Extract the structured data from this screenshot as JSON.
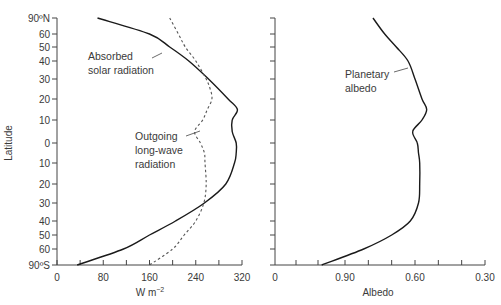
{
  "chart_data": [
    {
      "type": "line",
      "title": "",
      "xlabel": "W m⁻²",
      "ylabel": "Latitude",
      "xlim": [
        0,
        320
      ],
      "x_ticks": [
        0,
        80,
        160,
        240,
        320
      ],
      "x_minor_step": 40,
      "y_ticks": [
        "90ºN",
        "60",
        "50",
        "40",
        "30",
        "20",
        "10",
        "0",
        "10",
        "20",
        "30",
        "40",
        "50",
        "60",
        "90ºS"
      ],
      "y_axis_note": "sine-of-latitude spacing, north at top",
      "grid": false,
      "legend": "inline annotations",
      "series": [
        {
          "name": "Absorbed solar radiation",
          "style": "solid",
          "lat": [
            90,
            60,
            50,
            40,
            30,
            20,
            15,
            10,
            5,
            0,
            -5,
            -10,
            -20,
            -30,
            -40,
            -50,
            -60,
            -90
          ],
          "values": [
            70,
            160,
            195,
            228,
            262,
            296,
            312,
            303,
            303,
            310,
            310,
            307,
            292,
            255,
            205,
            160,
            115,
            35
          ]
        },
        {
          "name": "Outgoing long-wave radiation",
          "style": "dashed",
          "lat": [
            90,
            60,
            50,
            40,
            30,
            25,
            20,
            15,
            10,
            5,
            0,
            -5,
            -10,
            -20,
            -30,
            -40,
            -50,
            -60,
            -90
          ],
          "values": [
            195,
            210,
            222,
            240,
            258,
            265,
            268,
            260,
            252,
            238,
            248,
            255,
            256,
            258,
            254,
            240,
            220,
            200,
            160
          ]
        }
      ],
      "annotations": [
        {
          "text": [
            "Absorbed",
            "solar radiation"
          ],
          "points_to": "Absorbed solar radiation"
        },
        {
          "text": [
            "Outgoing",
            "long-wave",
            "radiation"
          ],
          "points_to": "Outgoing long-wave radiation"
        }
      ]
    },
    {
      "type": "line",
      "title": "",
      "xlabel": "Albedo",
      "ylabel": "",
      "x_ticks": [
        "0",
        "0.90",
        "0.60",
        "0.30"
      ],
      "x_axis_note": "reversed axis: 0.90 to 0.30 left to right, with 0 at far left",
      "y_ticks": "shared with left panel (unlabeled)",
      "grid": false,
      "series": [
        {
          "name": "Planetary albedo",
          "style": "solid",
          "lat": [
            90,
            60,
            50,
            40,
            30,
            20,
            15,
            10,
            5,
            0,
            -5,
            -10,
            -20,
            -30,
            -40,
            -50,
            -60,
            -90
          ],
          "values": [
            0.78,
            0.73,
            0.68,
            0.63,
            0.6,
            0.57,
            0.55,
            0.57,
            0.61,
            0.59,
            0.585,
            0.58,
            0.58,
            0.585,
            0.62,
            0.7,
            0.82,
            1.0
          ]
        }
      ],
      "annotations": [
        {
          "text": [
            "Planetary",
            "albedo"
          ],
          "points_to": "Planetary albedo"
        }
      ]
    }
  ],
  "left": {
    "ylabel": "Latitude",
    "xlabel_main": "W m",
    "xlabel_sup": "−2",
    "x_tick_labels": [
      "0",
      "80",
      "160",
      "240",
      "320"
    ],
    "y_tick_labels": [
      "90ºN",
      "60",
      "50",
      "40",
      "30",
      "20",
      "10",
      "0",
      "10",
      "20",
      "30",
      "40",
      "50",
      "60",
      "90ºS"
    ],
    "ann_solar_1": "Absorbed",
    "ann_solar_2": "solar radiation",
    "ann_olr_1": "Outgoing",
    "ann_olr_2": "long-wave",
    "ann_olr_3": "radiation"
  },
  "right": {
    "xlabel": "Albedo",
    "x_tick_labels": [
      "0",
      "0.90",
      "0.60",
      "0.30"
    ],
    "ann_1": "Planetary",
    "ann_2": "albedo"
  },
  "colors": {
    "axis": "#444444",
    "line": "#1a1a1a",
    "text": "#3a3a3a"
  }
}
